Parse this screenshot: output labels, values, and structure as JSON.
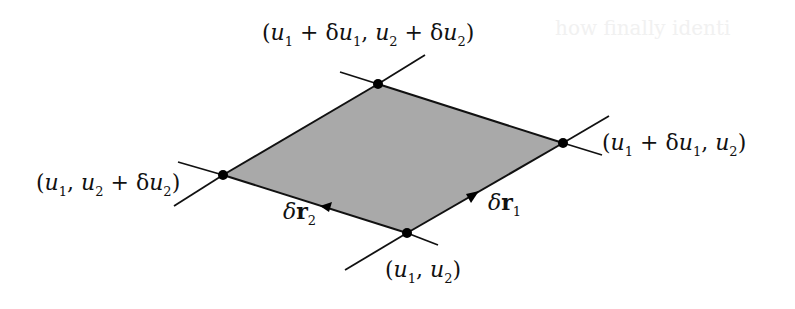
{
  "diagram": {
    "fill_color": "#a9a9a9",
    "stroke_color": "#111111",
    "vertices": {
      "bottom": {
        "x": 407,
        "y": 233,
        "label": "(u1, u2)"
      },
      "right": {
        "x": 563,
        "y": 143,
        "label": "(u1 + δu1, u2)"
      },
      "top": {
        "x": 378,
        "y": 84,
        "label": "(u1 + δu1, u2 + δu2)"
      },
      "left": {
        "x": 223,
        "y": 175,
        "label": "(u1, u2 + δu2)"
      }
    },
    "labels": {
      "top": {
        "open": "(",
        "u": "u",
        "s1": "1",
        "plus": " + δ",
        "u2a": "u",
        "s2": "1",
        "comma": ", ",
        "u3": "u",
        "s3": "2",
        "plus2": " + δ",
        "u4": "u",
        "s4": "2",
        "close": ")"
      },
      "right": {
        "open": "(",
        "u": "u",
        "s1": "1",
        "plus": " + δ",
        "u2a": "u",
        "s2": "1",
        "comma": ", ",
        "u3": "u",
        "s3": "2",
        "close": ")"
      },
      "left": {
        "open": "(",
        "u": "u",
        "s1": "1",
        "comma": ", ",
        "u2a": "u",
        "s2": "2",
        "plus": " + δ",
        "u3": "u",
        "s3": "2",
        "close": ")"
      },
      "bottom": {
        "open": "(",
        "u": "u",
        "s1": "1",
        "comma": ", ",
        "u2a": "u",
        "s2": "2",
        "close": ")"
      }
    },
    "vectors": {
      "dr1": {
        "delta": "δ",
        "symbol": "r",
        "subscript": "1",
        "from": "bottom",
        "to": "right"
      },
      "dr2": {
        "delta": "δ",
        "symbol": "r",
        "subscript": "2",
        "from": "bottom",
        "to": "left"
      }
    },
    "background_ghost_text": "how finally identi"
  }
}
